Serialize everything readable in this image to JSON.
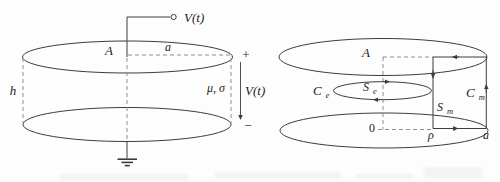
{
  "figure": {
    "colors": {
      "bg": "#fdfdfd",
      "line": "#3c3c3c",
      "dash": "#8e8e8e",
      "text": "#1c1c1c",
      "artifact": "#e9e9e9"
    },
    "left_diagram": {
      "source_label": "V(t)",
      "area_label": "A",
      "radius_label": "a",
      "height_label": "h",
      "medium_label": "μ, σ",
      "plus_sign": "+",
      "voltage_label": "V(t)",
      "minus_sign": "−"
    },
    "right_diagram": {
      "area_label": "A",
      "electric_contour_label": {
        "main": "C",
        "sub": "e"
      },
      "electric_surface_label": {
        "main": "S",
        "sub": "e"
      },
      "magnetic_surface_label": {
        "main": "S",
        "sub": "m"
      },
      "magnetic_contour_label": {
        "main": "C",
        "sub": "m"
      },
      "origin_label": "0",
      "radial_coordinate_label": "ρ",
      "plate_radius_label": "a"
    }
  }
}
